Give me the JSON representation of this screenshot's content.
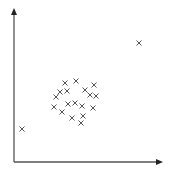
{
  "chart_data": {
    "type": "scatter",
    "title": "",
    "xlabel": "",
    "ylabel": "",
    "grid": false,
    "legend": null,
    "marker": "x",
    "axes": {
      "origin_px": [
        14,
        162
      ],
      "x_end_px": 163,
      "y_end_px": 8,
      "color": "#555555"
    },
    "marker_color": "#555555",
    "points_px": [
      [
        139,
        43
      ],
      [
        22,
        129
      ],
      [
        65,
        83
      ],
      [
        76,
        81
      ],
      [
        94,
        85
      ],
      [
        60,
        92
      ],
      [
        67,
        91
      ],
      [
        85,
        90
      ],
      [
        56,
        97
      ],
      [
        90,
        95
      ],
      [
        96,
        96
      ],
      [
        54,
        107
      ],
      [
        68,
        104
      ],
      [
        75,
        103
      ],
      [
        82,
        106
      ],
      [
        93,
        108
      ],
      [
        62,
        112
      ],
      [
        72,
        118
      ],
      [
        83,
        116
      ],
      [
        81,
        123
      ]
    ],
    "groups": {
      "outliers": [
        [
          139,
          43
        ],
        [
          22,
          129
        ]
      ],
      "cluster_center_px": [
        75,
        102
      ]
    }
  }
}
